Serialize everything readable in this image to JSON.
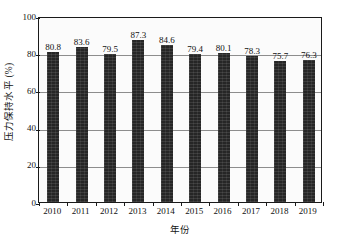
{
  "chart_data": {
    "type": "bar",
    "title": "",
    "xlabel": "年份",
    "ylabel": "压力保持水平 (%)",
    "categories": [
      "2010",
      "2011",
      "2012",
      "2013",
      "2014",
      "2015",
      "2016",
      "2017",
      "2018",
      "2019"
    ],
    "values": [
      80.8,
      83.6,
      79.5,
      87.3,
      84.6,
      79.4,
      80.1,
      78.3,
      75.7,
      76.3
    ],
    "value_labels": [
      "80.8",
      "83.6",
      "79.5",
      "87.3",
      "84.6",
      "79.4",
      "80.1",
      "78.3",
      "75.7",
      "76.3"
    ],
    "ylim": [
      0,
      100
    ],
    "xlim_categories": 10,
    "y_ticks": [
      0,
      20,
      40,
      60,
      80,
      100
    ],
    "y_tick_labels": [
      "0",
      "20",
      "40",
      "60",
      "80",
      "100"
    ],
    "grid": "horizontal",
    "legend": null,
    "legend_position": "none",
    "series": [
      {
        "name": "压力保持水平",
        "values": [
          80.8,
          83.6,
          79.5,
          87.3,
          84.6,
          79.4,
          80.1,
          78.3,
          75.7,
          76.3
        ]
      }
    ],
    "colors": {
      "bar": "#262626",
      "axis": "#1a1a1a",
      "gridline": "#8d8d8d",
      "background": "#fbfbfb",
      "text": "#111111"
    }
  }
}
